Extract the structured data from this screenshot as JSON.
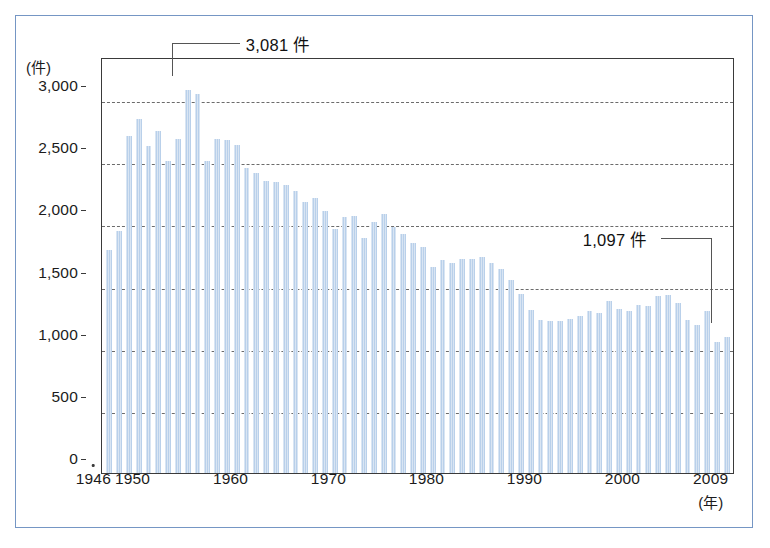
{
  "chart_data": {
    "type": "bar",
    "title": "",
    "subtitle": "",
    "xlabel": "(年)",
    "ylabel": "(件)",
    "ylim": [
      0,
      3200
    ],
    "yticks": [
      0,
      500,
      1000,
      1500,
      2000,
      2500,
      3000
    ],
    "ytick_labels": [
      "0",
      "500",
      "1,000",
      "1,500",
      "2,000",
      "2,500",
      "3,000"
    ],
    "xtick_years": [
      1946,
      1950,
      1960,
      1970,
      1980,
      1990,
      2000,
      2009
    ],
    "xtick_labels": [
      "1946",
      "1950",
      "1960",
      "1970",
      "1980",
      "1990",
      "2000",
      "2009"
    ],
    "grid": "horizontal-dashed",
    "legend": "none",
    "bar_color": "#b9d0ea",
    "categories": [
      1946,
      1947,
      1948,
      1949,
      1950,
      1951,
      1952,
      1953,
      1954,
      1955,
      1956,
      1957,
      1958,
      1959,
      1960,
      1961,
      1962,
      1963,
      1964,
      1965,
      1966,
      1967,
      1968,
      1969,
      1970,
      1971,
      1972,
      1973,
      1974,
      1975,
      1976,
      1977,
      1978,
      1979,
      1980,
      1981,
      1982,
      1983,
      1984,
      1985,
      1986,
      1987,
      1988,
      1989,
      1990,
      1991,
      1992,
      1993,
      1994,
      1995,
      1996,
      1997,
      1998,
      1999,
      2000,
      2001,
      2002,
      2003,
      2004,
      2005,
      2006,
      2007,
      2008,
      2009
    ],
    "values": [
      1790,
      1950,
      2710,
      2850,
      2630,
      2750,
      2510,
      2690,
      3081,
      3052,
      2510,
      2690,
      2680,
      2640,
      2450,
      2410,
      2350,
      2340,
      2320,
      2270,
      2180,
      2210,
      2110,
      1960,
      2060,
      2070,
      1890,
      2020,
      2080,
      1980,
      1920,
      1850,
      1820,
      1660,
      1710,
      1690,
      1720,
      1720,
      1740,
      1690,
      1640,
      1550,
      1440,
      1310,
      1230,
      1220,
      1220,
      1240,
      1260,
      1300,
      1290,
      1380,
      1320,
      1300,
      1350,
      1340,
      1420,
      1430,
      1370,
      1230,
      1190,
      1300,
      1050,
      1097
    ],
    "annotations": [
      {
        "name": "peak-annotation",
        "label": "3,081 件",
        "year": 1954,
        "value": 3081
      },
      {
        "name": "last-annotation",
        "label": "1,097 件",
        "year": 2009,
        "value": 1097
      }
    ]
  }
}
